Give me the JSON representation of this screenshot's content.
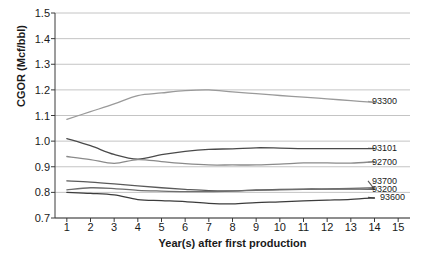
{
  "chart_data": {
    "type": "line",
    "title": "",
    "xlabel": "Year(s) after first production",
    "ylabel": "CGOR (Mcf/bbl)",
    "x": [
      1,
      2,
      3,
      4,
      5,
      6,
      7,
      8,
      9,
      10,
      11,
      12,
      13,
      14,
      15
    ],
    "xlim": [
      0.5,
      15.5
    ],
    "ylim": [
      0.7,
      1.5
    ],
    "xticks": [
      "1",
      "2",
      "3",
      "4",
      "5",
      "6",
      "7",
      "8",
      "9",
      "10",
      "11",
      "12",
      "13",
      "14",
      "15"
    ],
    "yticks": [
      "0.7",
      "0.8",
      "0.9",
      "1.0",
      "1.1",
      "1.2",
      "1.3",
      "1.4",
      "1.5"
    ],
    "grid": "horizontal",
    "legend_position": "right-inline-labels",
    "series": [
      {
        "name": "93300",
        "color": "#9a9a9a",
        "values": [
          1.085,
          1.115,
          1.145,
          1.178,
          1.188,
          1.197,
          1.2,
          1.192,
          1.185,
          1.178,
          1.172,
          1.165,
          1.158,
          1.151,
          null
        ],
        "label_y": 1.155
      },
      {
        "name": "93101",
        "color": "#4a4a4a",
        "values": [
          1.01,
          0.982,
          0.948,
          0.93,
          0.947,
          0.96,
          0.968,
          0.97,
          0.974,
          0.973,
          0.971,
          0.971,
          0.971,
          0.971,
          null
        ],
        "label_y": 0.972
      },
      {
        "name": "92700",
        "color": "#8a8a8a",
        "values": [
          0.94,
          0.928,
          0.913,
          0.928,
          0.92,
          0.912,
          0.907,
          0.907,
          0.907,
          0.91,
          0.915,
          0.915,
          0.914,
          0.92,
          null
        ],
        "label_y": 0.917
      },
      {
        "name": "93700",
        "color": "#5a5a5a",
        "values": [
          0.845,
          0.84,
          0.833,
          0.825,
          0.818,
          0.812,
          0.807,
          0.806,
          0.81,
          0.812,
          0.813,
          0.813,
          0.813,
          0.812,
          null
        ],
        "label_y": 0.845
      },
      {
        "name": "93200",
        "color": "#6e6e6e",
        "values": [
          0.81,
          0.818,
          0.815,
          0.808,
          0.805,
          0.803,
          0.803,
          0.805,
          0.808,
          0.81,
          0.812,
          0.814,
          0.816,
          0.818,
          null
        ],
        "label_y": 0.812
      },
      {
        "name": "93600",
        "color": "#3c3c3c",
        "values": [
          0.8,
          0.796,
          0.79,
          0.772,
          0.768,
          0.764,
          0.757,
          0.755,
          0.76,
          0.763,
          0.767,
          0.77,
          0.773,
          0.778,
          null
        ],
        "label_y": 0.781
      }
    ]
  }
}
